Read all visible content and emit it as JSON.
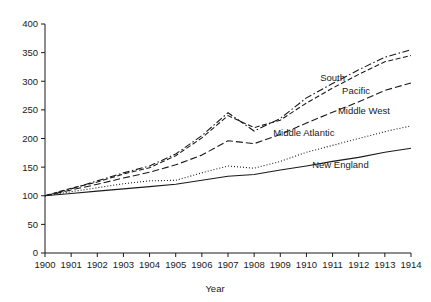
{
  "chart_data": {
    "type": "line",
    "title": "",
    "xlabel": "Year",
    "ylabel": "",
    "xlim": [
      1900,
      1914
    ],
    "ylim": [
      0,
      400
    ],
    "grid": false,
    "legend_position": "inline-right",
    "x": [
      1900,
      1901,
      1902,
      1903,
      1904,
      1905,
      1906,
      1907,
      1908,
      1909,
      1910,
      1911,
      1912,
      1913,
      1914
    ],
    "x_tick_labels": [
      "1900",
      "1901",
      "1902",
      "1903",
      "1904",
      "1905",
      "1906",
      "1907",
      "1908",
      "1909",
      "1910",
      "1911",
      "1912",
      "1913",
      "1914"
    ],
    "y_tick_labels": [
      "0",
      "50",
      "100",
      "150",
      "200",
      "250",
      "300",
      "350",
      "400"
    ],
    "y_ticks": [
      0,
      50,
      100,
      150,
      200,
      250,
      300,
      350,
      400
    ],
    "series": [
      {
        "name": "South",
        "style": "dash-dot",
        "label_x": 1911.0,
        "label_y": 300,
        "values": [
          100,
          112,
          126,
          140,
          152,
          173,
          205,
          245,
          213,
          235,
          271,
          296,
          320,
          342,
          355
        ]
      },
      {
        "name": "Pacific",
        "style": "dashed",
        "label_x": 1911.9,
        "label_y": 277,
        "values": [
          100,
          113,
          124,
          138,
          149,
          170,
          201,
          240,
          219,
          232,
          262,
          288,
          312,
          334,
          345
        ]
      },
      {
        "name": "Middle West",
        "style": "long-dash",
        "label_x": 1912.2,
        "label_y": 243,
        "values": [
          100,
          110,
          120,
          131,
          141,
          154,
          171,
          196,
          191,
          207,
          227,
          246,
          264,
          284,
          297
        ]
      },
      {
        "name": "Middle Atlantic",
        "style": "dotted",
        "label_x": 1909.9,
        "label_y": 205,
        "values": [
          100,
          107,
          114,
          121,
          126,
          127,
          140,
          152,
          148,
          160,
          176,
          188,
          200,
          212,
          222
        ]
      },
      {
        "name": "New England",
        "style": "solid",
        "label_x": 1911.3,
        "label_y": 148,
        "values": [
          100,
          104,
          108,
          112,
          116,
          120,
          127,
          134,
          137,
          145,
          152,
          160,
          167,
          176,
          183
        ]
      }
    ]
  }
}
